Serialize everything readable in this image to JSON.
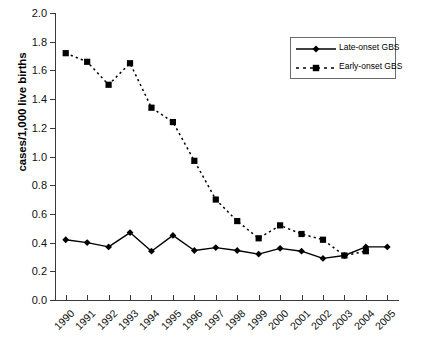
{
  "chart_data": {
    "type": "line",
    "title": "",
    "xlabel": "",
    "ylabel": "cases/1,000 live births",
    "categories": [
      "1990",
      "1991",
      "1992",
      "1993",
      "1994",
      "1995",
      "1996",
      "1997",
      "1998",
      "1999",
      "2000",
      "2001",
      "2002",
      "2003",
      "2004",
      "2005"
    ],
    "ylim": [
      0.0,
      2.0
    ],
    "ytick_labels": [
      "0.0",
      "0.2",
      "0.4",
      "0.6",
      "0.8",
      "1.0",
      "1.2",
      "1.4",
      "1.6",
      "1.8",
      "2.0"
    ],
    "ytick_values": [
      0.0,
      0.2,
      0.4,
      0.6,
      0.8,
      1.0,
      1.2,
      1.4,
      1.6,
      1.8,
      2.0
    ],
    "grid": false,
    "legend_position": "top-right",
    "series": [
      {
        "name": "Late-onset GBS",
        "marker": "diamond",
        "linestyle": "solid",
        "color": "#000000",
        "values": [
          0.42,
          0.4,
          0.37,
          0.47,
          0.34,
          0.45,
          0.345,
          0.365,
          0.345,
          0.32,
          0.36,
          0.34,
          0.29,
          0.31,
          0.37,
          0.37
        ]
      },
      {
        "name": "Early-onset GBS",
        "marker": "square",
        "linestyle": "dashed",
        "color": "#000000",
        "values": [
          1.72,
          1.66,
          1.5,
          1.65,
          1.34,
          1.24,
          0.97,
          0.7,
          0.55,
          0.43,
          0.52,
          0.46,
          0.42,
          0.31,
          0.34,
          null
        ]
      }
    ]
  },
  "legend": {
    "items": [
      {
        "label": "Late-onset GBS"
      },
      {
        "label": "Early-onset GBS"
      }
    ]
  }
}
